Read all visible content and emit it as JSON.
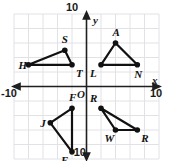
{
  "figure": {
    "name": "coordinate-plane-four-triangles",
    "background": "#ffffff",
    "grid_color": "#e2e2e6",
    "axis_color": "#1f1f1f",
    "shape_color": "#111111",
    "width": 171,
    "height": 161
  },
  "axes": {
    "x_axis_label": "x",
    "y_axis_label": "y",
    "origin_label": "O",
    "x_min_label": "-10",
    "x_max_label": "10",
    "y_min_label": "-10",
    "y_max_label": "10",
    "x_range": [
      -10,
      10
    ],
    "y_range": [
      -10,
      10
    ],
    "grid_step": 2,
    "grid": true
  },
  "chart_data": {
    "type": "scatter",
    "title": "",
    "xlabel": "x",
    "ylabel": "y",
    "xlim": [
      -10,
      10
    ],
    "ylim": [
      -10,
      10
    ],
    "grid": true,
    "shapes": [
      {
        "name": "triangle-HST",
        "quadrant": "upper-left",
        "vertices": [
          {
            "label": "H",
            "x": -8,
            "y": 3,
            "label_side": "left"
          },
          {
            "label": "S",
            "x": -3,
            "y": 5,
            "label_side": "above"
          },
          {
            "label": "T",
            "x": -2,
            "y": 3,
            "label_side": "below-right"
          }
        ]
      },
      {
        "name": "triangle-LAN",
        "quadrant": "upper-right",
        "vertices": [
          {
            "label": "L",
            "x": 2,
            "y": 3,
            "label_side": "below-left"
          },
          {
            "label": "A",
            "x": 4,
            "y": 6,
            "label_side": "above"
          },
          {
            "label": "N",
            "x": 7,
            "y": 3,
            "label_side": "below"
          }
        ]
      },
      {
        "name": "triangle-JFE",
        "quadrant": "lower-left",
        "vertices": [
          {
            "label": "J",
            "x": -5,
            "y": -5,
            "label_side": "left"
          },
          {
            "label": "F",
            "x": -2,
            "y": -3,
            "label_side": "above"
          },
          {
            "label": "E",
            "x": -2,
            "y": -9,
            "label_side": "below-left"
          }
        ]
      },
      {
        "name": "triangle-RWR",
        "quadrant": "lower-right",
        "vertices": [
          {
            "label": "R",
            "x": 2,
            "y": -3,
            "label_side": "above-left"
          },
          {
            "label": "W",
            "x": 4,
            "y": -6,
            "label_side": "below-left"
          },
          {
            "label": "R",
            "x": 7,
            "y": -6,
            "label_side": "below-right"
          }
        ]
      }
    ]
  }
}
